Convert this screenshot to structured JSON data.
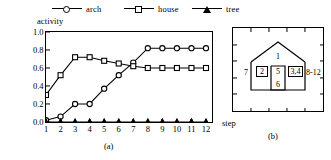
{
  "legend": {
    "items": [
      {
        "label": "arch",
        "marker": "circle-marker"
      },
      {
        "label": "house",
        "marker": "square-marker"
      },
      {
        "label": "tree",
        "marker": "triangle-marker"
      }
    ]
  },
  "axes": {
    "ylabel": "activity",
    "xlabel": "step",
    "yticks": [
      "0.0",
      "0.2",
      "0.4",
      "0.6",
      "0.8",
      "1.0"
    ],
    "xticks": [
      "1",
      "2",
      "3",
      "4",
      "5",
      "6",
      "7",
      "8",
      "9",
      "10",
      "11",
      "12"
    ]
  },
  "captions": {
    "panel_a": "(a)",
    "panel_b": "(b)"
  },
  "panel_b": {
    "name": "house-schematic",
    "labels": {
      "roof": "1",
      "left_window": "2",
      "door": "5",
      "right_window": "3,4",
      "left_outside": "7",
      "right_outside": "8-12",
      "floor": "6"
    }
  },
  "chart_data": {
    "type": "line",
    "title": "",
    "xlabel": "step",
    "ylabel": "activity",
    "x": [
      1,
      2,
      3,
      4,
      5,
      6,
      7,
      8,
      9,
      10,
      11,
      12
    ],
    "xlim": [
      1,
      12
    ],
    "ylim": [
      0.0,
      1.0
    ],
    "grid": false,
    "legend_position": "top",
    "series": [
      {
        "name": "arch",
        "marker": "circle",
        "values": [
          0.02,
          0.06,
          0.2,
          0.2,
          0.37,
          0.52,
          0.66,
          0.82,
          0.82,
          0.82,
          0.82,
          0.82
        ]
      },
      {
        "name": "house",
        "marker": "square",
        "values": [
          0.3,
          0.52,
          0.72,
          0.72,
          0.68,
          0.65,
          0.62,
          0.6,
          0.6,
          0.6,
          0.6,
          0.6
        ]
      },
      {
        "name": "tree",
        "marker": "triangle",
        "values": [
          0.0,
          0.0,
          0.0,
          0.0,
          0.0,
          0.0,
          0.0,
          0.0,
          0.0,
          0.0,
          0.0,
          0.0
        ]
      }
    ]
  },
  "colors": {
    "ink": "#000000",
    "paper": "#ffffff"
  }
}
